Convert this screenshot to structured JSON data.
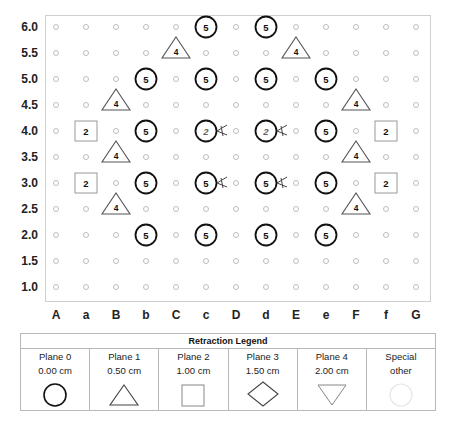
{
  "chart_data": {
    "type": "scatter",
    "title": "",
    "xlabel": "",
    "ylabel": "",
    "x_ticks": [
      "A",
      "a",
      "B",
      "b",
      "C",
      "c",
      "D",
      "d",
      "E",
      "e",
      "F",
      "f",
      "G"
    ],
    "y_ticks": [
      "6.0",
      "5.5",
      "5.0",
      "4.5",
      "4.0",
      "3.5",
      "3.0",
      "2.5",
      "2.0",
      "1.5",
      "1.0"
    ],
    "ylim": [
      1.0,
      6.0
    ],
    "grid_dots": true,
    "markers": [
      {
        "x": "c",
        "y": 6.0,
        "shape": "circle",
        "label": "5"
      },
      {
        "x": "d",
        "y": 6.0,
        "shape": "circle",
        "label": "5"
      },
      {
        "x": "C",
        "y": 5.5,
        "shape": "triangle",
        "label": "4"
      },
      {
        "x": "E",
        "y": 5.5,
        "shape": "triangle",
        "label": "4"
      },
      {
        "x": "b",
        "y": 5.0,
        "shape": "circle",
        "label": "5"
      },
      {
        "x": "c",
        "y": 5.0,
        "shape": "circle",
        "label": "5"
      },
      {
        "x": "d",
        "y": 5.0,
        "shape": "circle",
        "label": "5"
      },
      {
        "x": "e",
        "y": 5.0,
        "shape": "circle",
        "label": "5"
      },
      {
        "x": "B",
        "y": 4.5,
        "shape": "triangle",
        "label": "4"
      },
      {
        "x": "F",
        "y": 4.5,
        "shape": "triangle",
        "label": "4"
      },
      {
        "x": "a",
        "y": 4.0,
        "shape": "square",
        "label": "2"
      },
      {
        "x": "b",
        "y": 4.0,
        "shape": "circle",
        "label": "5"
      },
      {
        "x": "c",
        "y": 4.0,
        "shape": "circle",
        "label": "2",
        "cut_mark": true
      },
      {
        "x": "d",
        "y": 4.0,
        "shape": "circle",
        "label": "2",
        "cut_mark": true
      },
      {
        "x": "e",
        "y": 4.0,
        "shape": "circle",
        "label": "5"
      },
      {
        "x": "f",
        "y": 4.0,
        "shape": "square",
        "label": "2"
      },
      {
        "x": "B",
        "y": 3.5,
        "shape": "triangle",
        "label": "4"
      },
      {
        "x": "F",
        "y": 3.5,
        "shape": "triangle",
        "label": "4"
      },
      {
        "x": "a",
        "y": 3.0,
        "shape": "square",
        "label": "2"
      },
      {
        "x": "b",
        "y": 3.0,
        "shape": "circle",
        "label": "5"
      },
      {
        "x": "c",
        "y": 3.0,
        "shape": "circle",
        "label": "5",
        "cut_mark": true
      },
      {
        "x": "d",
        "y": 3.0,
        "shape": "circle",
        "label": "5",
        "cut_mark": true
      },
      {
        "x": "e",
        "y": 3.0,
        "shape": "circle",
        "label": "5"
      },
      {
        "x": "f",
        "y": 3.0,
        "shape": "square",
        "label": "2"
      },
      {
        "x": "B",
        "y": 2.5,
        "shape": "triangle",
        "label": "4"
      },
      {
        "x": "F",
        "y": 2.5,
        "shape": "triangle",
        "label": "4"
      },
      {
        "x": "b",
        "y": 2.0,
        "shape": "circle",
        "label": "5"
      },
      {
        "x": "c",
        "y": 2.0,
        "shape": "circle",
        "label": "5"
      },
      {
        "x": "d",
        "y": 2.0,
        "shape": "circle",
        "label": "5"
      },
      {
        "x": "e",
        "y": 2.0,
        "shape": "circle",
        "label": "5"
      }
    ]
  },
  "legend": {
    "title": "Retraction Legend",
    "items": [
      {
        "name": "Plane 0",
        "value": "0.00 cm",
        "shape": "circle-icon"
      },
      {
        "name": "Plane 1",
        "value": "0.50 cm",
        "shape": "triangle-icon"
      },
      {
        "name": "Plane 2",
        "value": "1.00 cm",
        "shape": "square-icon"
      },
      {
        "name": "Plane 3",
        "value": "1.50 cm",
        "shape": "diamond-icon"
      },
      {
        "name": "Plane 4",
        "value": "2.00 cm",
        "shape": "inverted-triangle-icon"
      },
      {
        "name": "Special",
        "value": "other",
        "shape": "faint-circle-icon"
      }
    ]
  },
  "colors": {
    "marker_stroke": "#111111",
    "legend_stroke": "#555555",
    "grid_dot": "#bdbdbd",
    "frame": "#cfcfcf"
  }
}
